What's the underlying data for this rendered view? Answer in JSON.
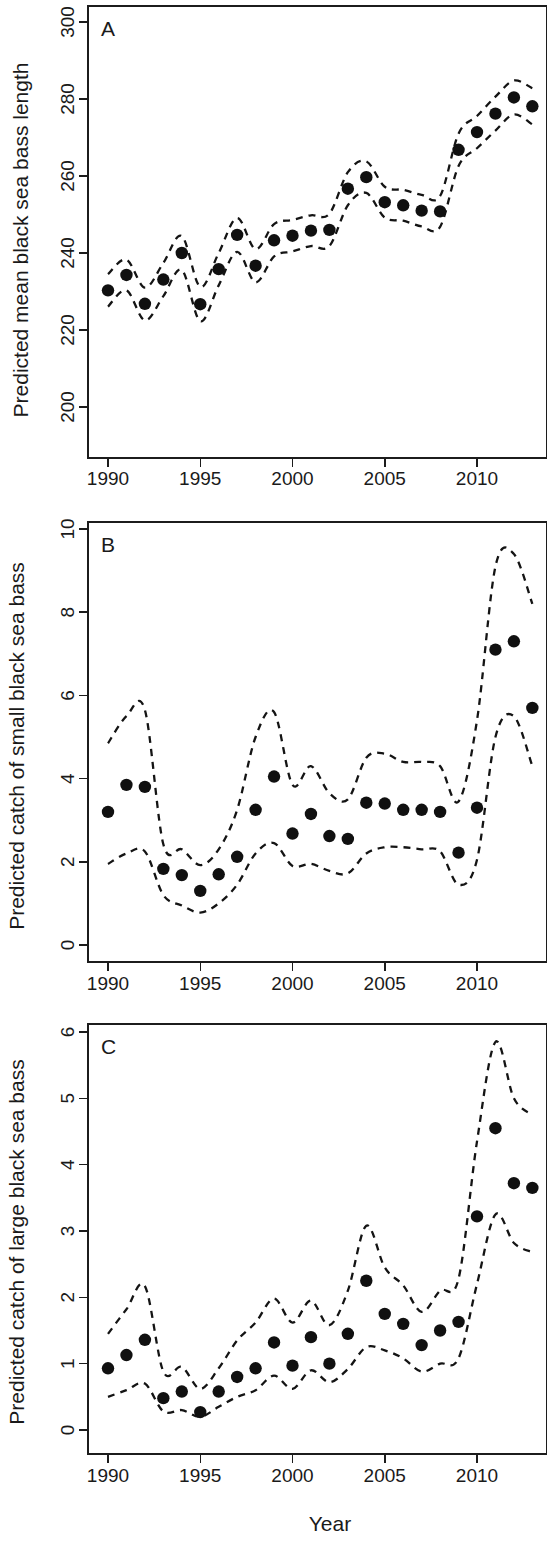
{
  "figure": {
    "xlabel": "Year",
    "panels": [
      "A",
      "B",
      "C"
    ]
  },
  "chart_data": [
    {
      "type": "scatter",
      "panel_label": "A",
      "title": "",
      "xlabel": "",
      "ylabel": "Predicted mean black sea bass length",
      "xlim": [
        1989.2,
        1913.8
      ],
      "x_range": [
        1989.2,
        2013.8
      ],
      "ylim": [
        196,
        304
      ],
      "yticks": [
        200,
        220,
        240,
        260,
        280,
        300
      ],
      "xticks": [
        1990,
        1995,
        2000,
        2005,
        2010
      ],
      "xticklabels": [
        "1990",
        "1995",
        "2000",
        "2005",
        "2010"
      ],
      "yticklabels": [
        "200",
        "220",
        "240",
        "260",
        "280",
        "300"
      ],
      "grid": false,
      "legend": "none",
      "x": [
        1990,
        1991,
        1992,
        1993,
        1994,
        1995,
        1996,
        1997,
        1998,
        1999,
        2000,
        2001,
        2002,
        2003,
        2004,
        2005,
        2006,
        2007,
        2008,
        2009,
        2010,
        2011,
        2012,
        2013
      ],
      "series": [
        {
          "name": "Predicted mean length",
          "values": [
            230.3,
            234.3,
            226.8,
            233.1,
            240.0,
            226.7,
            235.8,
            244.7,
            236.7,
            243.3,
            244.5,
            245.8,
            246.0,
            256.7,
            259.7,
            253.2,
            252.4,
            251.0,
            250.8,
            266.8,
            271.4,
            276.2,
            280.4,
            278.1
          ]
        },
        {
          "name": "Upper confidence limit",
          "values": [
            234.5,
            238.3,
            231.0,
            237.4,
            244.4,
            231.2,
            240.0,
            249.1,
            241.0,
            247.5,
            248.6,
            249.8,
            250.2,
            261.0,
            263.8,
            257.2,
            256.4,
            255.1,
            254.8,
            271.0,
            275.6,
            280.6,
            284.8,
            282.8
          ]
        },
        {
          "name": "Lower confidence limit",
          "values": [
            226.1,
            230.3,
            222.5,
            228.8,
            235.6,
            222.3,
            231.6,
            240.3,
            232.4,
            239.1,
            240.4,
            241.8,
            241.8,
            252.4,
            255.6,
            249.2,
            248.4,
            246.9,
            246.8,
            262.6,
            267.2,
            271.8,
            276.0,
            273.4
          ]
        }
      ]
    },
    {
      "type": "scatter",
      "panel_label": "B",
      "title": "",
      "xlabel": "",
      "ylabel": "Predicted catch of small black sea bass",
      "x_range": [
        1989.2,
        2013.8
      ],
      "ylim": [
        -0.35,
        10.45
      ],
      "yticks": [
        0,
        2,
        4,
        6,
        8,
        10
      ],
      "xticks": [
        1990,
        1995,
        2000,
        2005,
        2010
      ],
      "xticklabels": [
        "1990",
        "1995",
        "2000",
        "2005",
        "2010"
      ],
      "yticklabels": [
        "0",
        "2",
        "4",
        "6",
        "8",
        "10"
      ],
      "grid": false,
      "legend": "none",
      "x": [
        1990,
        1991,
        1992,
        1993,
        1994,
        1995,
        1996,
        1997,
        1998,
        1999,
        2000,
        2001,
        2002,
        2003,
        2004,
        2005,
        2006,
        2007,
        2008,
        2009,
        2010,
        2011,
        2012,
        2013
      ],
      "series": [
        {
          "name": "Predicted catch (small)",
          "values": [
            3.2,
            3.85,
            3.8,
            1.83,
            1.68,
            1.3,
            1.7,
            2.12,
            3.25,
            4.05,
            2.68,
            3.15,
            2.62,
            2.55,
            3.42,
            3.4,
            3.25,
            3.25,
            3.2,
            2.22,
            3.3,
            7.1,
            7.3,
            5.7
          ]
        },
        {
          "name": "Upper confidence limit",
          "values": [
            4.85,
            5.5,
            5.65,
            2.42,
            2.3,
            1.92,
            2.3,
            3.25,
            5.0,
            5.6,
            3.85,
            4.3,
            3.65,
            3.5,
            4.5,
            4.6,
            4.4,
            4.4,
            4.3,
            3.45,
            5.4,
            9.1,
            9.4,
            8.2
          ]
        },
        {
          "name": "Lower confidence limit",
          "values": [
            1.95,
            2.2,
            2.25,
            1.2,
            0.95,
            0.78,
            1.0,
            1.45,
            2.2,
            2.45,
            1.9,
            1.95,
            1.78,
            1.72,
            2.2,
            2.35,
            2.35,
            2.3,
            2.25,
            1.45,
            2.05,
            5.0,
            5.5,
            4.3
          ]
        }
      ]
    },
    {
      "type": "scatter",
      "panel_label": "C",
      "title": "",
      "xlabel": "Year",
      "ylabel": "Predicted catch of large black sea bass",
      "x_range": [
        1989.2,
        2013.8
      ],
      "ylim": [
        -0.22,
        6.28
      ],
      "yticks": [
        0,
        1,
        2,
        3,
        4,
        5,
        6
      ],
      "xticks": [
        1990,
        1995,
        2000,
        2005,
        2010
      ],
      "xticklabels": [
        "1990",
        "1995",
        "2000",
        "2005",
        "2010"
      ],
      "yticklabels": [
        "0",
        "1",
        "2",
        "3",
        "4",
        "5",
        "6"
      ],
      "grid": false,
      "legend": "none",
      "x": [
        1990,
        1991,
        1992,
        1993,
        1994,
        1995,
        1996,
        1997,
        1998,
        1999,
        2000,
        2001,
        2002,
        2003,
        2004,
        2005,
        2006,
        2007,
        2008,
        2009,
        2010,
        2011,
        2012,
        2013
      ],
      "series": [
        {
          "name": "Predicted catch (large)",
          "values": [
            0.93,
            1.13,
            1.36,
            0.48,
            0.58,
            0.27,
            0.58,
            0.8,
            0.93,
            1.32,
            0.97,
            1.4,
            1.0,
            1.45,
            2.25,
            1.75,
            1.6,
            1.28,
            1.5,
            1.63,
            3.22,
            4.55,
            3.72,
            3.65
          ]
        },
        {
          "name": "Upper confidence limit",
          "values": [
            1.45,
            1.82,
            2.17,
            0.88,
            0.95,
            0.62,
            0.93,
            1.35,
            1.62,
            1.98,
            1.62,
            1.95,
            1.58,
            2.1,
            3.08,
            2.45,
            2.18,
            1.78,
            2.1,
            2.28,
            4.35,
            5.85,
            5.0,
            4.75
          ]
        },
        {
          "name": "Lower confidence limit",
          "values": [
            0.5,
            0.6,
            0.7,
            0.28,
            0.3,
            0.2,
            0.35,
            0.5,
            0.6,
            0.82,
            0.62,
            0.9,
            0.72,
            0.92,
            1.25,
            1.2,
            1.08,
            0.88,
            1.0,
            1.08,
            2.2,
            3.25,
            2.82,
            2.68
          ]
        }
      ]
    }
  ]
}
